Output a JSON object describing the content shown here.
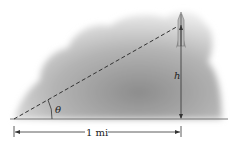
{
  "diagram": {
    "angle_label": "θ",
    "height_label": "h",
    "distance_label": "1 mi",
    "colors": {
      "cloud": "#9a9a9a",
      "line": "#333333",
      "background": "#ffffff"
    }
  }
}
